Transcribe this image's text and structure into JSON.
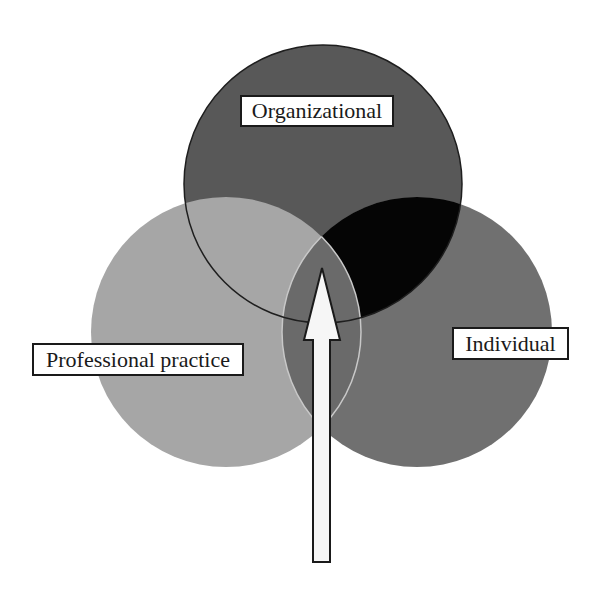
{
  "diagram": {
    "type": "venn",
    "sets": [
      {
        "id": "organizational",
        "label": "Organizational",
        "fill": "#585858",
        "cx": 323,
        "cy": 184,
        "r": 139
      },
      {
        "id": "professional",
        "label": "Professional practice",
        "fill": "#a6a6a6",
        "cx": 226,
        "cy": 332,
        "r": 135
      },
      {
        "id": "individual",
        "label": "Individual",
        "fill": "#707070",
        "cx": 417,
        "cy": 332,
        "r": 135
      }
    ],
    "overlaps": {
      "organizational_individual": "#050505",
      "professional_individual": "#6a6a6a"
    },
    "arrow": {
      "direction": "up",
      "fill": "#f6f6f6",
      "stroke": "#1a1a1a"
    }
  },
  "labels": {
    "organizational": "Organizational",
    "professional": "Professional practice",
    "individual": "Individual"
  }
}
